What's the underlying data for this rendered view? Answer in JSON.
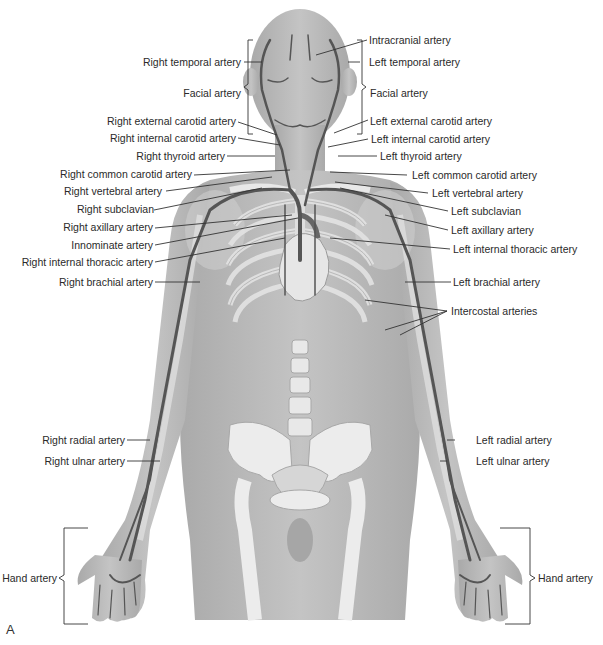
{
  "figure": {
    "panel_letter": "A",
    "colors": {
      "background": "#ffffff",
      "skin": "#b9b9b9",
      "skin_light": "#cfcfcf",
      "bone": "#ececec",
      "bone_outline": "#a8a8a8",
      "artery": "#555555",
      "leader_line": "#333333",
      "text": "#2a2a2a"
    }
  },
  "labels_right_side": [
    {
      "id": "right-temporal-artery",
      "text": "Right temporal artery"
    },
    {
      "id": "right-facial-artery",
      "text": "Facial artery"
    },
    {
      "id": "right-external-carotid-artery",
      "text": "Right external carotid artery"
    },
    {
      "id": "right-internal-carotid-artery",
      "text": "Right internal carotid artery"
    },
    {
      "id": "right-thyroid-artery",
      "text": "Right thyroid artery"
    },
    {
      "id": "right-common-carotid-artery",
      "text": "Right common carotid artery"
    },
    {
      "id": "right-vertebral-artery",
      "text": "Right vertebral artery"
    },
    {
      "id": "right-subclavian",
      "text": "Right subclavian"
    },
    {
      "id": "right-axillary-artery",
      "text": "Right axillary artery"
    },
    {
      "id": "innominate-artery",
      "text": "Innominate artery"
    },
    {
      "id": "right-internal-thoracic-artery",
      "text": "Right internal thoracic artery"
    },
    {
      "id": "right-brachial-artery",
      "text": "Right brachial artery"
    },
    {
      "id": "right-radial-artery",
      "text": "Right radial artery"
    },
    {
      "id": "right-ulnar-artery",
      "text": "Right ulnar artery"
    },
    {
      "id": "right-hand-artery",
      "text": "Hand artery"
    }
  ],
  "labels_left_side": [
    {
      "id": "intracranial-artery",
      "text": "Intracranial artery"
    },
    {
      "id": "left-temporal-artery",
      "text": "Left temporal artery"
    },
    {
      "id": "left-facial-artery",
      "text": "Facial artery"
    },
    {
      "id": "left-external-carotid-artery",
      "text": "Left external carotid artery"
    },
    {
      "id": "left-internal-carotid-artery",
      "text": "Left internal carotid artery"
    },
    {
      "id": "left-thyroid-artery",
      "text": "Left thyroid artery"
    },
    {
      "id": "left-common-carotid-artery",
      "text": "Left common carotid artery"
    },
    {
      "id": "left-vertebral-artery",
      "text": "Left vertebral artery"
    },
    {
      "id": "left-subclavian",
      "text": "Left subclavian"
    },
    {
      "id": "left-axillary-artery",
      "text": "Left axillary artery"
    },
    {
      "id": "left-internal-thoracic-artery",
      "text": "Left internal thoracic artery"
    },
    {
      "id": "left-brachial-artery",
      "text": "Left brachial artery"
    },
    {
      "id": "intercostal-arteries",
      "text": "Intercostal arteries"
    },
    {
      "id": "left-radial-artery",
      "text": "Left radial artery"
    },
    {
      "id": "left-ulnar-artery",
      "text": "Left ulnar artery"
    },
    {
      "id": "left-hand-artery",
      "text": "Hand artery"
    }
  ]
}
